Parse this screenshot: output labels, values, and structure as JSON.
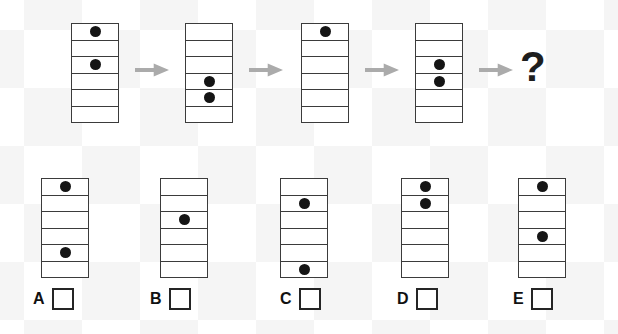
{
  "puzzle": {
    "rows_per_cell": 6,
    "unknown_symbol": "?",
    "colors": {
      "grid_line": "#3b3b3b",
      "dot": "#151515",
      "arrow": "#ababab"
    },
    "sequence": [
      {
        "name": "step-1",
        "dot_rows": [
          1,
          3
        ]
      },
      {
        "name": "step-2",
        "dot_rows": [
          4,
          5
        ]
      },
      {
        "name": "step-3",
        "dot_rows": [
          1
        ]
      },
      {
        "name": "step-4",
        "dot_rows": [
          3,
          4
        ]
      }
    ],
    "options": [
      {
        "label": "A",
        "dot_rows": [
          1,
          5
        ],
        "checked": false
      },
      {
        "label": "B",
        "dot_rows": [
          3
        ],
        "checked": false
      },
      {
        "label": "C",
        "dot_rows": [
          2,
          6
        ],
        "checked": false
      },
      {
        "label": "D",
        "dot_rows": [
          1,
          2
        ],
        "checked": false
      },
      {
        "label": "E",
        "dot_rows": [
          1,
          4
        ],
        "checked": false
      }
    ]
  }
}
